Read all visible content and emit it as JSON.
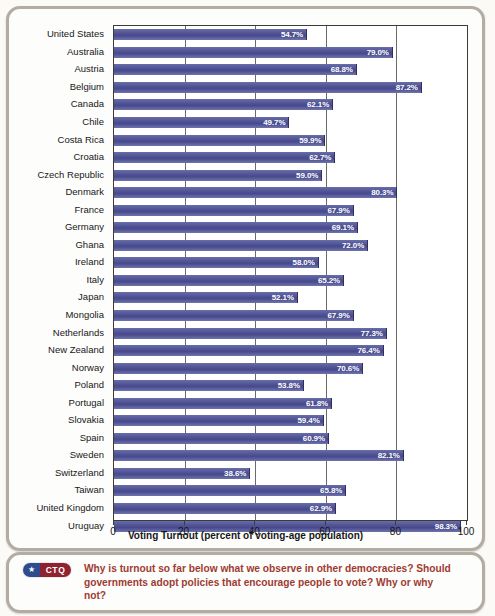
{
  "chart_data": {
    "type": "bar",
    "orientation": "horizontal",
    "title": "",
    "xlabel": "Voting Turnout (percent of voting-age population)",
    "ylabel": "",
    "xlim": [
      0,
      100
    ],
    "xticks": [
      "0",
      "20",
      "40",
      "60",
      "80",
      "100"
    ],
    "grid": true,
    "legend": false,
    "value_suffix": "%",
    "categories": [
      "United States",
      "Australia",
      "Austria",
      "Belgium",
      "Canada",
      "Chile",
      "Costa Rica",
      "Croatia",
      "Czech Republic",
      "Denmark",
      "France",
      "Germany",
      "Ghana",
      "Ireland",
      "Italy",
      "Japan",
      "Mongolia",
      "Netherlands",
      "New Zealand",
      "Norway",
      "Poland",
      "Portugal",
      "Slovakia",
      "Spain",
      "Sweden",
      "Switzerland",
      "Taiwan",
      "United Kingdom",
      "Uruguay"
    ],
    "values": [
      54.7,
      79.0,
      68.8,
      87.2,
      62.1,
      49.7,
      59.9,
      62.7,
      59.0,
      80.3,
      67.9,
      69.1,
      72.0,
      58.0,
      65.2,
      52.1,
      67.9,
      77.3,
      76.4,
      70.6,
      53.8,
      61.8,
      59.4,
      60.9,
      82.1,
      38.6,
      65.8,
      62.9,
      98.3
    ],
    "data_labels": [
      "54.7%",
      "79.0%",
      "68.8%",
      "87.2%",
      "62.1%",
      "49.7%",
      "59.9%",
      "62.7%",
      "59.0%",
      "80.3%",
      "67.9%",
      "69.1%",
      "72.0%",
      "58.0%",
      "65.2%",
      "52.1%",
      "67.9%",
      "77.3%",
      "76.4%",
      "70.6%",
      "53.8%",
      "61.8%",
      "59.4%",
      "60.9%",
      "82.1%",
      "38.6%",
      "65.8%",
      "62.9%",
      "98.3%"
    ],
    "colors": {
      "bar": "#4e4f92",
      "bar_highlight": "#676ea8",
      "data_label": "#ffffff",
      "axis": "#3b3b3b",
      "gridline": "#6a6a6a",
      "plot_background": "#ffffff"
    }
  },
  "ctq": {
    "badge_star": "★",
    "badge_label": "CTQ",
    "question": "Why is turnout so far below what we observe in other democracies? Should governments adopt policies that encourage people to vote? Why or why not?",
    "badge_blue": "#2e4d8e",
    "badge_red": "#8e2230",
    "text_color": "#9d3b33"
  },
  "frame": {
    "border_color": "#b3aca2",
    "background": "#fdfdfb"
  }
}
